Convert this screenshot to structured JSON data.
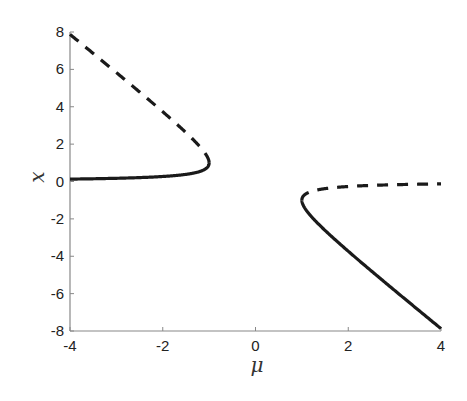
{
  "chart_data": {
    "type": "line",
    "title": "",
    "xlabel": "μ",
    "ylabel": "x",
    "xlim": [
      -4,
      4
    ],
    "ylim": [
      -8,
      8
    ],
    "xticks": [
      -4,
      -2,
      0,
      2,
      4
    ],
    "yticks": [
      -8,
      -6,
      -4,
      -2,
      0,
      2,
      4,
      6,
      8
    ],
    "xtick_labels": [
      "-4",
      "-2",
      "0",
      "2",
      "4"
    ],
    "ytick_labels": [
      "-8",
      "-6",
      "-4",
      "-2",
      "0",
      "2",
      "4",
      "6",
      "8"
    ],
    "grid": false,
    "legend": null,
    "axes_box": "left-bottom only",
    "series": [
      {
        "name": "left stable branch",
        "style": "solid",
        "equation": "x = -μ - sqrt(μ^2 - 1), μ in [-4, -1]",
        "x": [
          -4,
          -3.5,
          -3,
          -2.5,
          -2,
          -1.5,
          -1.2,
          -1.05,
          -1
        ],
        "y": [
          0.13,
          0.15,
          0.17,
          0.21,
          0.27,
          0.38,
          0.54,
          0.73,
          1.0
        ]
      },
      {
        "name": "left unstable branch",
        "style": "dashed",
        "equation": "x = -μ + sqrt(μ^2 - 1), μ in [-4, -1]",
        "x": [
          -4,
          -3.5,
          -3,
          -2.5,
          -2,
          -1.5,
          -1.2,
          -1.05,
          -1
        ],
        "y": [
          7.87,
          6.85,
          5.83,
          4.79,
          3.73,
          2.62,
          1.86,
          1.37,
          1.0
        ]
      },
      {
        "name": "right stable branch",
        "style": "solid",
        "equation": "x = -μ - sqrt(μ^2 - 1), μ in [1, 4]",
        "x": [
          1,
          1.05,
          1.2,
          1.5,
          2,
          2.5,
          3,
          3.5,
          4
        ],
        "y": [
          -1.0,
          -1.37,
          -1.86,
          -2.62,
          -3.73,
          -4.79,
          -5.83,
          -6.85,
          -7.87
        ]
      },
      {
        "name": "right unstable branch",
        "style": "dashed",
        "equation": "x = -μ + sqrt(μ^2 - 1), μ in [1, 4]",
        "x": [
          1,
          1.05,
          1.2,
          1.5,
          2,
          2.5,
          3,
          3.5,
          4
        ],
        "y": [
          -1.0,
          -0.73,
          -0.54,
          -0.38,
          -0.27,
          -0.21,
          -0.17,
          -0.15,
          -0.13
        ]
      }
    ]
  }
}
